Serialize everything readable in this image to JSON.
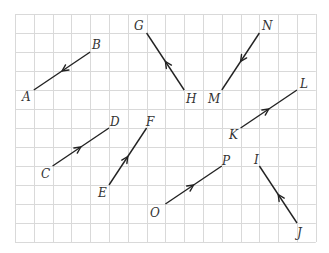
{
  "grid": {
    "origin_x": 15,
    "origin_y": 14,
    "cell_w": 18.8,
    "cell_h": 19,
    "cols": 16,
    "rows": 12,
    "line_color": "#d9d9d9"
  },
  "vectors": [
    {
      "name": "BA",
      "from": "B",
      "to": "A",
      "from_pt": [
        4,
        2
      ],
      "to_pt": [
        1,
        4
      ]
    },
    {
      "name": "CD",
      "from": "C",
      "to": "D",
      "from_pt": [
        2,
        8
      ],
      "to_pt": [
        5,
        6
      ]
    },
    {
      "name": "EF",
      "from": "E",
      "to": "F",
      "from_pt": [
        5,
        9
      ],
      "to_pt": [
        7,
        6
      ]
    },
    {
      "name": "HG",
      "from": "H",
      "to": "G",
      "from_pt": [
        9,
        4
      ],
      "to_pt": [
        7,
        1
      ]
    },
    {
      "name": "NM",
      "from": "N",
      "to": "M",
      "from_pt": [
        13,
        1
      ],
      "to_pt": [
        11,
        4
      ]
    },
    {
      "name": "KL",
      "from": "K",
      "to": "L",
      "from_pt": [
        12,
        6
      ],
      "to_pt": [
        15,
        4
      ]
    },
    {
      "name": "OP",
      "from": "O",
      "to": "P",
      "from_pt": [
        8,
        10
      ],
      "to_pt": [
        11,
        8
      ]
    },
    {
      "name": "JI",
      "from": "J",
      "to": "I",
      "from_pt": [
        15,
        11
      ],
      "to_pt": [
        13,
        8
      ]
    }
  ],
  "labels": {
    "A": "A",
    "B": "B",
    "C": "C",
    "D": "D",
    "E": "E",
    "F": "F",
    "G": "G",
    "H": "H",
    "I": "I",
    "J": "J",
    "K": "K",
    "L": "L",
    "M": "M",
    "N": "N",
    "O": "O",
    "P": "P"
  },
  "colors": {
    "vector": "#222222",
    "label": "#333333",
    "background": "#ffffff"
  }
}
